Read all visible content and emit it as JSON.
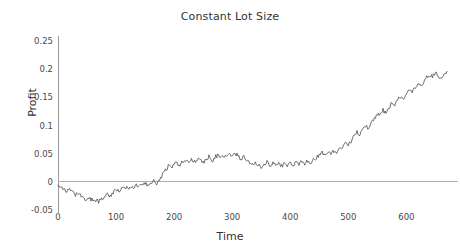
{
  "chart_data": {
    "type": "line",
    "title": "Constant Lot Size",
    "xlabel": "Time",
    "ylabel": "Profit",
    "grid": false,
    "legend": "none",
    "xlim": [
      0,
      670
    ],
    "ylim": [
      -0.05,
      0.26
    ],
    "xticks": [
      0,
      100,
      200,
      300,
      400,
      500,
      600
    ],
    "xtick_labels": [
      "0",
      "100",
      "200",
      "300",
      "400",
      "500",
      "600"
    ],
    "yticks": [
      -0.05,
      0,
      0.05,
      0.1,
      0.15,
      0.2,
      0.25
    ],
    "ytick_labels": [
      "-0.05",
      "0",
      "0.05",
      "0.1",
      "0.15",
      "0.2",
      "0.25"
    ],
    "zero_reference_line": 0,
    "series": [
      {
        "name": "Profit",
        "color": "#4d4d4d",
        "x": [
          0,
          5,
          10,
          15,
          20,
          25,
          30,
          35,
          40,
          45,
          50,
          55,
          60,
          65,
          70,
          75,
          80,
          85,
          90,
          95,
          100,
          105,
          110,
          115,
          120,
          125,
          130,
          135,
          140,
          145,
          150,
          155,
          160,
          165,
          170,
          175,
          180,
          185,
          190,
          195,
          200,
          205,
          210,
          215,
          220,
          225,
          230,
          235,
          240,
          245,
          250,
          255,
          260,
          265,
          270,
          275,
          280,
          285,
          290,
          295,
          300,
          305,
          310,
          315,
          320,
          325,
          330,
          335,
          340,
          345,
          350,
          355,
          360,
          365,
          370,
          375,
          380,
          385,
          390,
          395,
          400,
          405,
          410,
          415,
          420,
          425,
          430,
          435,
          440,
          445,
          450,
          455,
          460,
          465,
          470,
          475,
          480,
          485,
          490,
          495,
          500,
          505,
          510,
          515,
          520,
          525,
          530,
          535,
          540,
          545,
          550,
          555,
          560,
          565,
          570,
          575,
          580,
          585,
          590,
          595,
          600,
          605,
          610,
          615,
          620,
          625,
          630,
          635,
          640,
          645,
          650,
          655,
          660,
          665,
          670
        ],
        "y": [
          -0.004,
          -0.008,
          -0.012,
          -0.018,
          -0.014,
          -0.019,
          -0.024,
          -0.021,
          -0.026,
          -0.031,
          -0.033,
          -0.029,
          -0.034,
          -0.032,
          -0.035,
          -0.031,
          -0.026,
          -0.022,
          -0.025,
          -0.019,
          -0.014,
          -0.018,
          -0.013,
          -0.009,
          -0.012,
          -0.008,
          -0.011,
          -0.006,
          -0.009,
          -0.004,
          -0.002,
          -0.006,
          -0.003,
          0.001,
          -0.002,
          0.002,
          0.013,
          0.021,
          0.028,
          0.024,
          0.031,
          0.034,
          0.03,
          0.035,
          0.038,
          0.034,
          0.039,
          0.036,
          0.041,
          0.038,
          0.034,
          0.04,
          0.045,
          0.036,
          0.043,
          0.048,
          0.041,
          0.046,
          0.043,
          0.049,
          0.044,
          0.051,
          0.046,
          0.04,
          0.045,
          0.038,
          0.033,
          0.029,
          0.034,
          0.03,
          0.026,
          0.031,
          0.035,
          0.029,
          0.034,
          0.03,
          0.033,
          0.028,
          0.032,
          0.029,
          0.034,
          0.03,
          0.035,
          0.031,
          0.036,
          0.033,
          0.038,
          0.034,
          0.039,
          0.043,
          0.048,
          0.052,
          0.047,
          0.053,
          0.049,
          0.055,
          0.05,
          0.057,
          0.063,
          0.07,
          0.066,
          0.073,
          0.08,
          0.088,
          0.084,
          0.092,
          0.1,
          0.096,
          0.105,
          0.113,
          0.122,
          0.118,
          0.127,
          0.122,
          0.131,
          0.14,
          0.136,
          0.145,
          0.152,
          0.148,
          0.156,
          0.163,
          0.158,
          0.166,
          0.173,
          0.169,
          0.178,
          0.185,
          0.19,
          0.186,
          0.193,
          0.188,
          0.182,
          0.189,
          0.196
        ]
      }
    ],
    "series_detail": {
      "description": "Single jagged cumulative profit curve: dips to about -0.035 near t=50, crosses zero near t=115, plateaus around 0.03-0.05 from t=130 to t=340, rises steeply from t=350 to t=450 reaching about 0.19, oscillates around 0.18-0.20 from t=450 to t=620, then climbs to about 0.25 at the right edge near t=665.",
      "min_value": -0.035,
      "max_value": 0.253,
      "start_value": -0.004,
      "end_value": 0.253
    }
  }
}
